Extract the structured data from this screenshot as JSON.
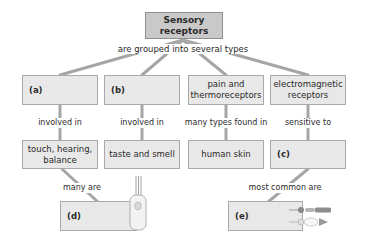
{
  "diagram": {
    "root": {
      "label": "Sensory receptors"
    },
    "root_link_label": "are grouped into several types",
    "columns": [
      {
        "type_label": "(a)",
        "link_label": "involved in",
        "target_label": "touch, hearing, balance"
      },
      {
        "type_label": "(b)",
        "link_label": "involved in",
        "target_label": "taste and smell"
      },
      {
        "type_label": "pain and thermoreceptors",
        "link_label": "many types found in",
        "target_label": "human skin"
      },
      {
        "type_label": "electromagnetic receptors",
        "link_label": "sensitive to",
        "target_label": "(c)"
      }
    ],
    "leaves": [
      {
        "link_label": "many are",
        "label": "(d)",
        "icon": "hair-cell-icon"
      },
      {
        "link_label": "most common are",
        "label": "(e)",
        "icon": "rod-cone-cells-icon"
      }
    ],
    "colors": {
      "root_fill": "#c9c9c9",
      "box_fill": "#e8e8e8",
      "line": "#a6a6a6",
      "border": "#a9a9a9"
    }
  }
}
